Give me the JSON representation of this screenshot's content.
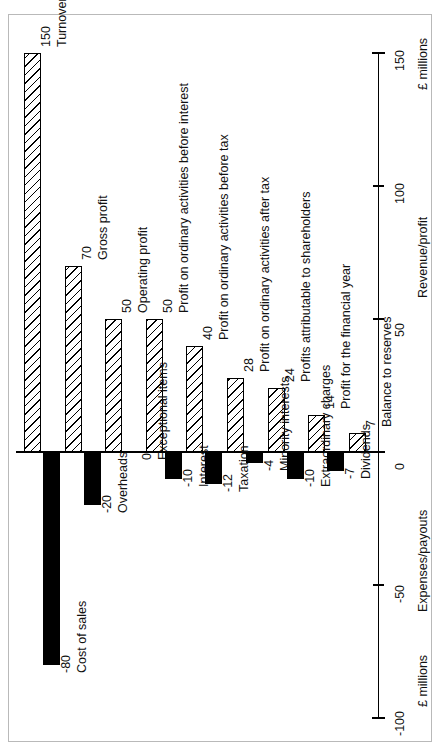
{
  "chart_data": {
    "type": "bar",
    "title": "",
    "subtitle": "",
    "orientation": "vertical-bars-with-rotated-labels",
    "xlabel": "",
    "ylabel": "£ millions",
    "ylim": [
      -100,
      150
    ],
    "yticks": [
      -100,
      -50,
      0,
      50,
      100,
      150
    ],
    "grid": false,
    "legend": "none",
    "axis_units": "£ millions",
    "axis_upper_title": "Revenue/profit",
    "axis_lower_title": "Expenses/payouts",
    "axis_upper_units": "£ millions",
    "axis_lower_units": "£ millions",
    "axis_upper_ticks": [
      "0",
      "50",
      "100",
      "150"
    ],
    "axis_lower_ticks": [
      "0",
      "-50",
      "-100"
    ],
    "series": [
      {
        "name": "Revenue/profit",
        "style": "hatched",
        "categories": [
          "Turnover",
          "Gross profit",
          "Operating profit",
          "Profit on ordinary activities before interest",
          "Profit on ordinary activities before tax",
          "Profit on ordinary activities after tax",
          "Profits attributable to shareholders",
          "Profit for the financial year",
          "Balance to reserves"
        ],
        "values": [
          150,
          70,
          50,
          50,
          40,
          28,
          24,
          14,
          7
        ]
      },
      {
        "name": "Expenses/payouts",
        "style": "solid-black",
        "categories": [
          "Cost of sales",
          "Overheads",
          "Exceptional items",
          "Interest",
          "Taxation",
          "Minority interests",
          "Extraordinary charges",
          "Dividends"
        ],
        "values": [
          -80,
          -20,
          0,
          -10,
          -12,
          -4,
          -10,
          -7
        ]
      }
    ],
    "positive_bars": [
      {
        "label": "Turnover",
        "value": 150,
        "value_text": "150"
      },
      {
        "label": "Gross profit",
        "value": 70,
        "value_text": "70"
      },
      {
        "label": "Operating profit",
        "value": 50,
        "value_text": "50"
      },
      {
        "label": "Profit on ordinary activities before interest",
        "value": 50,
        "value_text": "50"
      },
      {
        "label": "Profit on ordinary activities before tax",
        "value": 40,
        "value_text": "40"
      },
      {
        "label": "Profit on ordinary activities after tax",
        "value": 28,
        "value_text": "28"
      },
      {
        "label": "Profits attributable to shareholders",
        "value": 24,
        "value_text": "24"
      },
      {
        "label": "Profit for the financial year",
        "value": 14,
        "value_text": "14"
      },
      {
        "label": "Balance to reserves",
        "value": 7,
        "value_text": "7"
      }
    ],
    "negative_bars": [
      {
        "label": "Cost of sales",
        "value": -80,
        "value_text": "-80"
      },
      {
        "label": "Overheads",
        "value": -20,
        "value_text": "-20"
      },
      {
        "label": "Exceptional items",
        "value": 0,
        "value_text": "0"
      },
      {
        "label": "Interest",
        "value": -10,
        "value_text": "-10"
      },
      {
        "label": "Taxation",
        "value": -12,
        "value_text": "-12"
      },
      {
        "label": "Minority interests",
        "value": -4,
        "value_text": "-4"
      },
      {
        "label": "Extraordinary charges",
        "value": -10,
        "value_text": "-10"
      },
      {
        "label": "Dividends",
        "value": -7,
        "value_text": "-7"
      }
    ]
  }
}
